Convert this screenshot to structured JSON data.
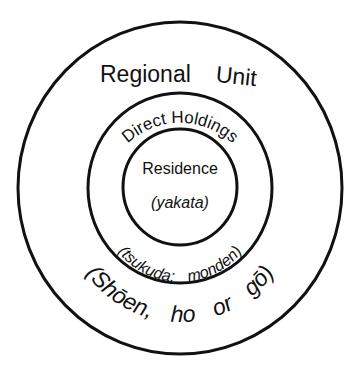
{
  "diagram": {
    "type": "concentric-circles",
    "rings": [
      {
        "name": "outer",
        "title": "Regional Unit",
        "title_words": [
          "Regional",
          "Unit"
        ],
        "subtitle": "(Shōen, ho or gō)",
        "subtitle_parts": [
          "(Shōen,",
          "ho",
          "or",
          "gō)"
        ]
      },
      {
        "name": "middle",
        "title": "Direct Holdings",
        "subtitle": "(tsukuda; monden)"
      },
      {
        "name": "inner",
        "title": "Residence",
        "subtitle": "(yakata)"
      }
    ],
    "colors": {
      "stroke": "#111111",
      "text": "#111111",
      "background": "#ffffff"
    }
  }
}
